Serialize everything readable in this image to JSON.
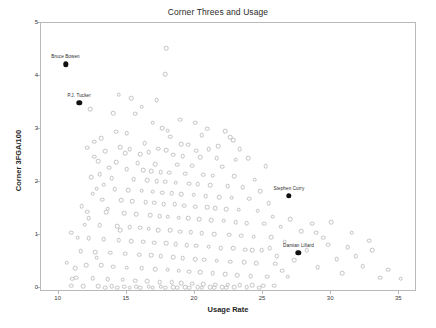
{
  "chart_data": {
    "type": "scatter",
    "title": "Corner Threes and Usage",
    "xlabel": "Usage Rate",
    "ylabel": "Corner 3FGA/100",
    "xlim": [
      8.7,
      36.3
    ],
    "ylim": [
      -0.07,
      5.0
    ],
    "xticks": [
      10,
      15,
      20,
      25,
      30,
      35
    ],
    "yticks": [
      0,
      1,
      2,
      3,
      4,
      5
    ],
    "grid": false,
    "legend": null,
    "marker_color": "#c2c2c2",
    "highlight_color": "#111111",
    "highlighted": [
      {
        "label": "Bruce Bowen",
        "x": 10.5,
        "y": 4.22
      },
      {
        "label": "P.J. Tucker",
        "x": 11.5,
        "y": 3.5
      },
      {
        "label": "Stephen Curry",
        "x": 26.9,
        "y": 1.74
      },
      {
        "label": "Damian Lillard",
        "x": 27.6,
        "y": 0.67
      }
    ],
    "points": [
      [
        17.9,
        4.53
      ],
      [
        17.8,
        4.03
      ],
      [
        14.4,
        3.65
      ],
      [
        15.3,
        3.58
      ],
      [
        12.3,
        3.38
      ],
      [
        14.0,
        3.3
      ],
      [
        15.6,
        3.29
      ],
      [
        16.9,
        3.12
      ],
      [
        17.6,
        3.02
      ],
      [
        18.0,
        2.97
      ],
      [
        22.2,
        2.96
      ],
      [
        20.9,
        3.01
      ],
      [
        13.1,
        2.83
      ],
      [
        18.2,
        2.86
      ],
      [
        22.6,
        2.85
      ],
      [
        12.6,
        2.76
      ],
      [
        16.3,
        2.73
      ],
      [
        19.5,
        2.71
      ],
      [
        14.5,
        2.66
      ],
      [
        15.2,
        2.62
      ],
      [
        17.3,
        2.63
      ],
      [
        17.9,
        2.6
      ],
      [
        20.1,
        2.59
      ],
      [
        21.0,
        2.62
      ],
      [
        13.4,
        2.58
      ],
      [
        14.9,
        2.55
      ],
      [
        16.0,
        2.53
      ],
      [
        16.6,
        2.56
      ],
      [
        18.4,
        2.52
      ],
      [
        19.1,
        2.49
      ],
      [
        20.4,
        2.47
      ],
      [
        21.6,
        2.45
      ],
      [
        23.0,
        2.42
      ],
      [
        12.9,
        2.4
      ],
      [
        14.2,
        2.38
      ],
      [
        15.8,
        2.36
      ],
      [
        17.1,
        2.34
      ],
      [
        18.7,
        2.33
      ],
      [
        19.8,
        2.31
      ],
      [
        22.0,
        2.29
      ],
      [
        13.7,
        2.27
      ],
      [
        15.0,
        2.25
      ],
      [
        16.2,
        2.23
      ],
      [
        16.8,
        2.21
      ],
      [
        17.5,
        2.19
      ],
      [
        18.1,
        2.18
      ],
      [
        19.3,
        2.16
      ],
      [
        20.6,
        2.14
      ],
      [
        21.3,
        2.12
      ],
      [
        22.9,
        2.11
      ],
      [
        12.4,
        2.09
      ],
      [
        13.9,
        2.07
      ],
      [
        15.5,
        2.06
      ],
      [
        16.5,
        2.04
      ],
      [
        17.2,
        2.02
      ],
      [
        17.8,
        2.01
      ],
      [
        18.6,
        1.99
      ],
      [
        19.6,
        1.97
      ],
      [
        20.2,
        1.96
      ],
      [
        21.1,
        1.94
      ],
      [
        22.4,
        1.92
      ],
      [
        23.5,
        1.9
      ],
      [
        12.8,
        1.88
      ],
      [
        14.1,
        1.87
      ],
      [
        15.1,
        1.85
      ],
      [
        16.1,
        1.84
      ],
      [
        16.9,
        1.82
      ],
      [
        17.6,
        1.8
      ],
      [
        18.3,
        1.79
      ],
      [
        19.0,
        1.77
      ],
      [
        19.9,
        1.76
      ],
      [
        20.8,
        1.74
      ],
      [
        21.8,
        1.72
      ],
      [
        22.7,
        1.71
      ],
      [
        24.0,
        1.69
      ],
      [
        13.2,
        1.67
      ],
      [
        14.6,
        1.66
      ],
      [
        15.4,
        1.64
      ],
      [
        16.4,
        1.62
      ],
      [
        17.0,
        1.61
      ],
      [
        17.7,
        1.59
      ],
      [
        18.5,
        1.58
      ],
      [
        19.2,
        1.56
      ],
      [
        20.0,
        1.54
      ],
      [
        20.9,
        1.53
      ],
      [
        21.5,
        1.51
      ],
      [
        22.3,
        1.49
      ],
      [
        23.2,
        1.48
      ],
      [
        24.6,
        1.46
      ],
      [
        12.1,
        1.44
      ],
      [
        13.5,
        1.43
      ],
      [
        14.8,
        1.41
      ],
      [
        15.7,
        1.4
      ],
      [
        16.7,
        1.38
      ],
      [
        17.4,
        1.36
      ],
      [
        18.0,
        1.35
      ],
      [
        18.8,
        1.33
      ],
      [
        19.5,
        1.32
      ],
      [
        20.3,
        1.3
      ],
      [
        21.2,
        1.28
      ],
      [
        22.1,
        1.27
      ],
      [
        23.0,
        1.25
      ],
      [
        23.8,
        1.23
      ],
      [
        25.1,
        1.22
      ],
      [
        11.9,
        1.2
      ],
      [
        13.0,
        1.19
      ],
      [
        14.3,
        1.17
      ],
      [
        15.2,
        1.15
      ],
      [
        16.0,
        1.14
      ],
      [
        16.6,
        1.12
      ],
      [
        17.3,
        1.1
      ],
      [
        18.2,
        1.09
      ],
      [
        18.9,
        1.07
      ],
      [
        19.7,
        1.06
      ],
      [
        20.5,
        1.04
      ],
      [
        21.4,
        1.02
      ],
      [
        22.5,
        1.01
      ],
      [
        23.4,
        0.99
      ],
      [
        24.3,
        0.97
      ],
      [
        25.6,
        0.96
      ],
      [
        12.2,
        0.94
      ],
      [
        13.3,
        0.93
      ],
      [
        14.4,
        0.91
      ],
      [
        15.3,
        0.89
      ],
      [
        16.2,
        0.88
      ],
      [
        17.0,
        0.86
      ],
      [
        17.9,
        0.85
      ],
      [
        18.6,
        0.83
      ],
      [
        19.4,
        0.81
      ],
      [
        20.1,
        0.8
      ],
      [
        21.0,
        0.78
      ],
      [
        21.9,
        0.76
      ],
      [
        22.8,
        0.75
      ],
      [
        23.7,
        0.73
      ],
      [
        24.9,
        0.72
      ],
      [
        11.6,
        0.7
      ],
      [
        12.7,
        0.68
      ],
      [
        13.8,
        0.67
      ],
      [
        14.9,
        0.65
      ],
      [
        15.9,
        0.63
      ],
      [
        16.8,
        0.62
      ],
      [
        17.5,
        0.6
      ],
      [
        18.4,
        0.59
      ],
      [
        19.1,
        0.57
      ],
      [
        20.0,
        0.55
      ],
      [
        20.7,
        0.54
      ],
      [
        21.6,
        0.52
      ],
      [
        22.6,
        0.5
      ],
      [
        23.6,
        0.49
      ],
      [
        24.5,
        0.47
      ],
      [
        25.9,
        0.46
      ],
      [
        12.0,
        0.44
      ],
      [
        13.1,
        0.43
      ],
      [
        14.0,
        0.41
      ],
      [
        15.0,
        0.39
      ],
      [
        16.1,
        0.38
      ],
      [
        17.1,
        0.36
      ],
      [
        18.0,
        0.35
      ],
      [
        18.8,
        0.33
      ],
      [
        19.6,
        0.31
      ],
      [
        20.4,
        0.3
      ],
      [
        21.3,
        0.28
      ],
      [
        22.2,
        0.27
      ],
      [
        23.1,
        0.25
      ],
      [
        24.1,
        0.23
      ],
      [
        25.3,
        0.22
      ],
      [
        11.3,
        0.2
      ],
      [
        12.5,
        0.19
      ],
      [
        13.6,
        0.17
      ],
      [
        14.7,
        0.16
      ],
      [
        15.6,
        0.14
      ],
      [
        16.5,
        0.13
      ],
      [
        17.4,
        0.12
      ],
      [
        18.3,
        0.11
      ],
      [
        19.0,
        0.1
      ],
      [
        19.8,
        0.09
      ],
      [
        20.6,
        0.08
      ],
      [
        21.5,
        0.07
      ],
      [
        22.4,
        0.07
      ],
      [
        23.3,
        0.06
      ],
      [
        24.2,
        0.06
      ],
      [
        25.0,
        0.05
      ],
      [
        10.9,
        0.05
      ],
      [
        11.8,
        0.04
      ],
      [
        12.9,
        0.04
      ],
      [
        13.9,
        0.04
      ],
      [
        14.8,
        0.03
      ],
      [
        15.7,
        0.03
      ],
      [
        16.6,
        0.03
      ],
      [
        17.5,
        0.03
      ],
      [
        18.4,
        0.02
      ],
      [
        19.3,
        0.02
      ],
      [
        20.2,
        0.02
      ],
      [
        21.1,
        0.02
      ],
      [
        22.0,
        0.02
      ],
      [
        22.9,
        0.02
      ],
      [
        23.8,
        0.02
      ],
      [
        24.7,
        0.01
      ],
      [
        13.4,
        0.01
      ],
      [
        14.3,
        0.01
      ],
      [
        15.2,
        0.01
      ],
      [
        16.0,
        0.01
      ],
      [
        16.9,
        0.01
      ],
      [
        17.8,
        0.01
      ],
      [
        18.7,
        0.01
      ],
      [
        19.6,
        0.01
      ],
      [
        20.5,
        0.01
      ],
      [
        21.4,
        0.01
      ],
      [
        22.3,
        0.01
      ],
      [
        25.8,
        0.05
      ],
      [
        26.3,
        1.16
      ],
      [
        26.6,
        0.88
      ],
      [
        27.0,
        1.3
      ],
      [
        27.3,
        0.53
      ],
      [
        27.8,
        1.08
      ],
      [
        28.2,
        0.72
      ],
      [
        28.6,
        1.22
      ],
      [
        29.0,
        0.4
      ],
      [
        29.4,
        0.95
      ],
      [
        30.0,
        1.25
      ],
      [
        30.4,
        0.55
      ],
      [
        30.8,
        0.28
      ],
      [
        31.2,
        0.77
      ],
      [
        31.8,
        0.6
      ],
      [
        32.3,
        0.42
      ],
      [
        33.0,
        0.72
      ],
      [
        33.6,
        0.2
      ],
      [
        25.4,
        1.6
      ],
      [
        25.7,
        1.35
      ],
      [
        26.0,
        0.6
      ],
      [
        26.4,
        0.33
      ],
      [
        24.8,
        1.83
      ],
      [
        24.4,
        2.05
      ],
      [
        25.2,
        2.3
      ],
      [
        23.9,
        2.45
      ],
      [
        23.3,
        2.62
      ],
      [
        22.8,
        2.79
      ],
      [
        24.2,
        0.72
      ],
      [
        25.5,
        0.75
      ],
      [
        26.8,
        0.22
      ],
      [
        12.5,
        1.78
      ],
      [
        11.7,
        1.55
      ],
      [
        12.2,
        1.32
      ],
      [
        11.4,
        0.95
      ],
      [
        12.8,
        0.58
      ],
      [
        11.2,
        0.38
      ],
      [
        13.0,
        2.15
      ],
      [
        12.6,
        2.48
      ],
      [
        13.3,
        1.95
      ],
      [
        12.1,
        2.65
      ],
      [
        14.5,
        1.1
      ],
      [
        13.6,
        1.5
      ],
      [
        35.1,
        0.18
      ],
      [
        34.2,
        0.35
      ],
      [
        32.8,
        0.9
      ],
      [
        31.5,
        1.05
      ],
      [
        29.8,
        0.82
      ],
      [
        28.9,
        1.05
      ],
      [
        10.6,
        0.48
      ],
      [
        10.9,
        1.05
      ],
      [
        11.0,
        0.18
      ],
      [
        19.0,
        2.72
      ],
      [
        20.5,
        2.88
      ],
      [
        21.7,
        2.68
      ],
      [
        18.9,
        3.18
      ],
      [
        20.0,
        3.12
      ],
      [
        16.1,
        3.42
      ],
      [
        17.2,
        3.55
      ],
      [
        15.0,
        2.92
      ],
      [
        14.2,
        2.95
      ]
    ]
  }
}
